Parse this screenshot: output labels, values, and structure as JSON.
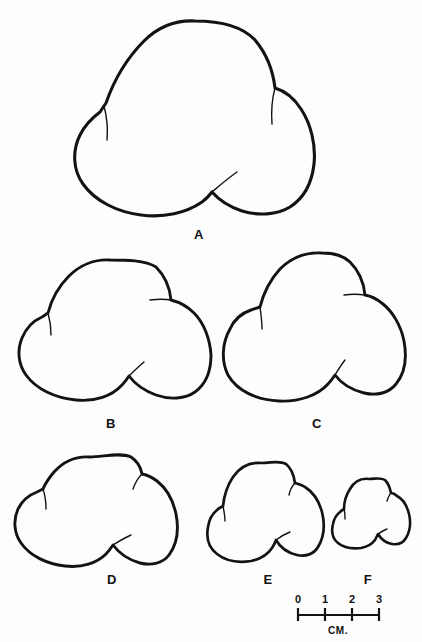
{
  "figure": {
    "background_color": "#fdfdfd",
    "ink_color": "#131313",
    "specimen_labels": [
      {
        "id": "A",
        "text": "A",
        "x": 199,
        "y": 236
      },
      {
        "id": "B",
        "text": "B",
        "x": 111,
        "y": 425
      },
      {
        "id": "C",
        "text": "C",
        "x": 317,
        "y": 425
      },
      {
        "id": "D",
        "text": "D",
        "x": 112,
        "y": 581
      },
      {
        "id": "E",
        "text": "E",
        "x": 268,
        "y": 581
      },
      {
        "id": "F",
        "text": "F",
        "x": 368,
        "y": 581
      }
    ],
    "scale_bar": {
      "unit_label": "CM.",
      "unit_label_x": 338,
      "unit_label_y": 638,
      "ticks": [
        {
          "label": "0",
          "x": 298
        },
        {
          "label": "1",
          "x": 325
        },
        {
          "label": "2",
          "x": 352
        },
        {
          "label": "3",
          "x": 379
        }
      ],
      "baseline_y": 615,
      "baseline_x1": 298,
      "baseline_x2": 379,
      "tick_top": 608,
      "tick_bottom": 621,
      "numbers_y": 604
    },
    "specimens": [
      {
        "id": "A",
        "name": "specimen-a",
        "stroke_width": 3.1,
        "outline": "M 195 21 C 171 20 150 31 134 50 C 118 69 106 92 102 111 C 95 118 89 122 85 130 C 78 144 79 161 86 177 C 94 196 111 209 132 214 C 155 219 182 215 199 203 C 204 199 209 195 212 191 C 224 203 243 211 262 212 C 283 213 300 205 309 189 C 319 171 318 148 310 127 C 303 109 291 96 277 90 C 274 73 266 54 254 41 C 238 25 216 21 195 21 Z",
        "sutures": [
          "M 102 111 C 104 121 105 130 104 141",
          "M 277 90 C 275 101 274 112 275 124",
          "M 212 191 C 218 186 226 180 236 174"
        ]
      },
      {
        "id": "B",
        "name": "specimen-b",
        "stroke_width": 2.9,
        "outline": "M 108 259 C 92 259 77 265 66 277 C 56 288 50 302 47 314 C 41 317 35 321 31 327 C 23 338 19 353 21 367 C 24 382 34 392 50 397 C 68 402 91 400 106 392 C 112 388 117 384 120 380 C 129 390 145 398 161 399 C 178 400 192 393 198 380 C 205 365 203 345 195 330 C 189 318 180 310 169 306 C 167 294 161 280 152 271 C 141 262 124 259 108 259 Z",
        "sutures": [
          "M 47 314 C 49 321 50 327 50 334",
          "M 169 306 C 165 303 160 301 153 300",
          "M 120 380 C 124 376 130 371 137 366"
        ]
      },
      {
        "id": "C",
        "name": "specimen-c",
        "stroke_width": 2.9,
        "outline": "M 325 253 C 307 253 292 260 281 272 C 271 283 266 297 264 309 C 257 306 249 304 241 305 C 227 306 240 304 239 305 C 251 304 242 305 241 305 C 226 307 241 305 240 305 C 250 304 242 305 240 305 L 240 305 C 231 305 239 305 240 305 Z",
        "sutures": []
      },
      {
        "id": "D",
        "name": "specimen-d",
        "stroke_width": 2.9,
        "outline": "M 88 456 C 75 456 62 463 53 474 C 48 479 45 485 43 490 C 36 492 29 497 25 504 C 18 514 15 527 17 539 C 20 551 30 560 44 564 C 60 568 80 566 93 558 C 99 554 104 549 107 544 C 115 554 128 561 142 562 C 155 563 166 557 171 545 C 177 531 175 514 167 501 C 161 490 152 483 142 479 C 140 470 134 462 126 458 C 115 454 101 455 88 456 Z",
        "sutures": [
          "M 43 490 C 45 497 47 503 47 510",
          "M 142 479 C 138 483 134 488 132 494",
          "M 107 544 C 112 541 118 537 125 534"
        ]
      },
      {
        "id": "E",
        "name": "specimen-e",
        "stroke_width": 2.7,
        "outline": "M 264 463 C 251 463 240 468 233 478 C 227 487 224 497 223 506 C 219 509 216 513 214 518 C 209 528 208 540 212 549 C 217 558 227 562 239 561 C 250 560 260 555 265 548 C 267 545 269 542 270 539 C 276 547 287 553 297 553 C 307 553 315 547 318 537 C 322 525 320 511 314 501 C 310 493 304 488 297 485 C 297 478 294 470 289 466 C 282 461 273 463 264 463 Z",
        "sutures": [
          "M 223 506 C 224 511 225 516 225 521",
          "M 297 485 C 294 488 291 492 290 497",
          "M 270 539 C 274 536 278 533 283 531"
        ]
      },
      {
        "id": "F",
        "name": "specimen-f",
        "stroke_width": 2.6,
        "outline": "M 370 479 C 362 479 355 483 351 490 C 347 496 345 503 345 509 C 342 511 340 514 339 518 C 336 525 336 533 339 539 C 343 545 350 548 357 547 C 365 546 371 542 374 537 C 375 535 376 533 377 531 C 381 537 388 541 394 541 C 400 541 405 537 407 530 C 410 522 409 512 405 505 C 402 500 398 497 394 495 C 394 490 392 485 389 482 C 384 478 377 479 370 479 Z",
        "sutures": [
          "M 345 509 C 346 512 346 515 346 518",
          "M 394 495 C 392 497 390 500 389 503",
          "M 377 531 C 380 529 383 527 386 526"
        ]
      }
    ]
  }
}
